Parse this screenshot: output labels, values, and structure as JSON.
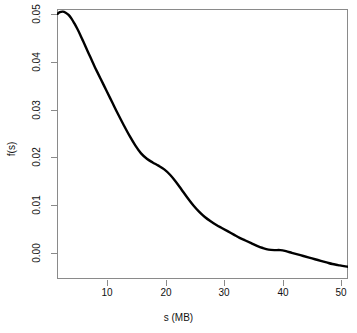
{
  "chart_data": {
    "type": "line",
    "title": "",
    "subtitle": "",
    "xlabel": "s (MB)",
    "ylabel": "f(s)",
    "xlim": [
      1.5,
      51.7
    ],
    "ylim": [
      0.0,
      0.0505
    ],
    "grid": false,
    "legend": null,
    "legend_position": "none",
    "xticks": [
      10,
      20,
      30,
      40,
      50
    ],
    "xtick_labels": [
      "10",
      "20",
      "30",
      "40",
      "50"
    ],
    "yticks": [
      0.0,
      0.01,
      0.02,
      0.03,
      0.04,
      0.05
    ],
    "ytick_labels": [
      "0.00",
      "0.01",
      "0.02",
      "0.03",
      "0.04",
      "0.05"
    ],
    "line_color": "#000000",
    "line_width": 2.4,
    "frame_color": "#8a8a8a",
    "background": "#ffffff",
    "annotations": [],
    "series": [
      {
        "name": "f(s)",
        "x": [
          1.6,
          2.0,
          2.5,
          3.0,
          3.5,
          4.0,
          4.5,
          5.0,
          5.5,
          6.0,
          6.5,
          7.0,
          7.5,
          8.0,
          8.5,
          9.0,
          9.5,
          10.0,
          11.0,
          12.0,
          13.0,
          14.0,
          15.0,
          16.0,
          17.0,
          18.0,
          19.0,
          20.0,
          21.0,
          22.0,
          23.0,
          24.0,
          25.0,
          26.0,
          27.0,
          28.0,
          29.0,
          30.0,
          31.0,
          32.0,
          33.0,
          34.0,
          35.0,
          36.0,
          37.0,
          38.0,
          39.0,
          40.0,
          41.0,
          42.0,
          43.0,
          44.0,
          45.0,
          46.0,
          47.0,
          48.0,
          49.0,
          50.0,
          51.0,
          51.7
        ],
        "y": [
          0.0496,
          0.0499,
          0.05,
          0.0498,
          0.0494,
          0.0487,
          0.0478,
          0.0468,
          0.0457,
          0.0445,
          0.0433,
          0.0421,
          0.0409,
          0.0397,
          0.0386,
          0.0375,
          0.0364,
          0.0353,
          0.0331,
          0.0309,
          0.0288,
          0.0268,
          0.025,
          0.0235,
          0.0225,
          0.0218,
          0.0212,
          0.0205,
          0.0195,
          0.0182,
          0.0167,
          0.0152,
          0.0138,
          0.0126,
          0.0116,
          0.0108,
          0.0101,
          0.0095,
          0.0089,
          0.0083,
          0.0077,
          0.0072,
          0.0067,
          0.0062,
          0.0058,
          0.0055,
          0.0054,
          0.0054,
          0.0052,
          0.0049,
          0.0046,
          0.0043,
          0.004,
          0.0037,
          0.0034,
          0.0031,
          0.0028,
          0.0026,
          0.0024,
          0.0023
        ]
      }
    ]
  },
  "axes": {
    "x_title": "s (MB)",
    "y_title": "f(s)"
  }
}
